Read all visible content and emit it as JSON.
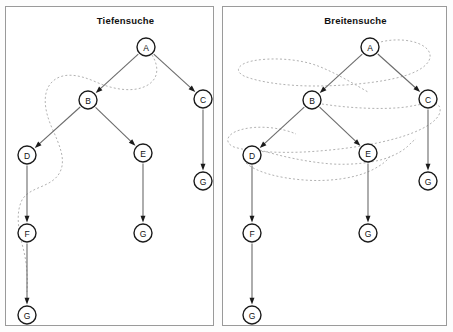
{
  "figure": {
    "background_color": "#fdfdfd",
    "panel_border_color": "#9a9a9a",
    "node_stroke_color": "#1b1b1b",
    "edge_color": "#6b6b6b",
    "trace_color": "#b2b2b2"
  },
  "panels": [
    {
      "id": "dfs",
      "title": "Tiefensuche",
      "nodes": [
        {
          "id": "A",
          "label": "A",
          "x": 146,
          "y": 47
        },
        {
          "id": "B",
          "label": "B",
          "x": 88,
          "y": 100
        },
        {
          "id": "C",
          "label": "C",
          "x": 203,
          "y": 99
        },
        {
          "id": "D",
          "label": "D",
          "x": 27,
          "y": 155
        },
        {
          "id": "E",
          "label": "E",
          "x": 143,
          "y": 153
        },
        {
          "id": "Gc",
          "label": "G",
          "x": 203,
          "y": 181
        },
        {
          "id": "F",
          "label": "F",
          "x": 27,
          "y": 233
        },
        {
          "id": "Ge",
          "label": "G",
          "x": 143,
          "y": 233
        },
        {
          "id": "Gf",
          "label": "G",
          "x": 27,
          "y": 315
        }
      ],
      "edges": [
        {
          "from": "A",
          "to": "B"
        },
        {
          "from": "A",
          "to": "C"
        },
        {
          "from": "B",
          "to": "D"
        },
        {
          "from": "B",
          "to": "E"
        },
        {
          "from": "C",
          "to": "Gc"
        },
        {
          "from": "D",
          "to": "F"
        },
        {
          "from": "E",
          "to": "Ge"
        },
        {
          "from": "F",
          "to": "Gf"
        }
      ],
      "trace_label": "depth-first traversal order",
      "trace_order": [
        "A",
        "B",
        "D",
        "F",
        "G"
      ]
    },
    {
      "id": "bfs",
      "title": "Breitensuche",
      "nodes": [
        {
          "id": "A",
          "label": "A",
          "x": 370,
          "y": 47
        },
        {
          "id": "B",
          "label": "B",
          "x": 312,
          "y": 100
        },
        {
          "id": "C",
          "label": "C",
          "x": 428,
          "y": 99
        },
        {
          "id": "D",
          "label": "D",
          "x": 252,
          "y": 155
        },
        {
          "id": "E",
          "label": "E",
          "x": 368,
          "y": 153
        },
        {
          "id": "Gc",
          "label": "G",
          "x": 428,
          "y": 181
        },
        {
          "id": "F",
          "label": "F",
          "x": 252,
          "y": 233
        },
        {
          "id": "Ge",
          "label": "G",
          "x": 368,
          "y": 233
        },
        {
          "id": "Gf",
          "label": "G",
          "x": 252,
          "y": 315
        }
      ],
      "edges": [
        {
          "from": "A",
          "to": "B"
        },
        {
          "from": "A",
          "to": "C"
        },
        {
          "from": "B",
          "to": "D"
        },
        {
          "from": "B",
          "to": "E"
        },
        {
          "from": "C",
          "to": "Gc"
        },
        {
          "from": "D",
          "to": "F"
        },
        {
          "from": "E",
          "to": "Ge"
        },
        {
          "from": "F",
          "to": "Gf"
        }
      ],
      "trace_label": "breadth-first traversal order",
      "trace_order": [
        "A",
        "B",
        "C",
        "D",
        "E"
      ]
    }
  ],
  "geometry": {
    "node_radius": 9,
    "arrow_size": 4
  }
}
